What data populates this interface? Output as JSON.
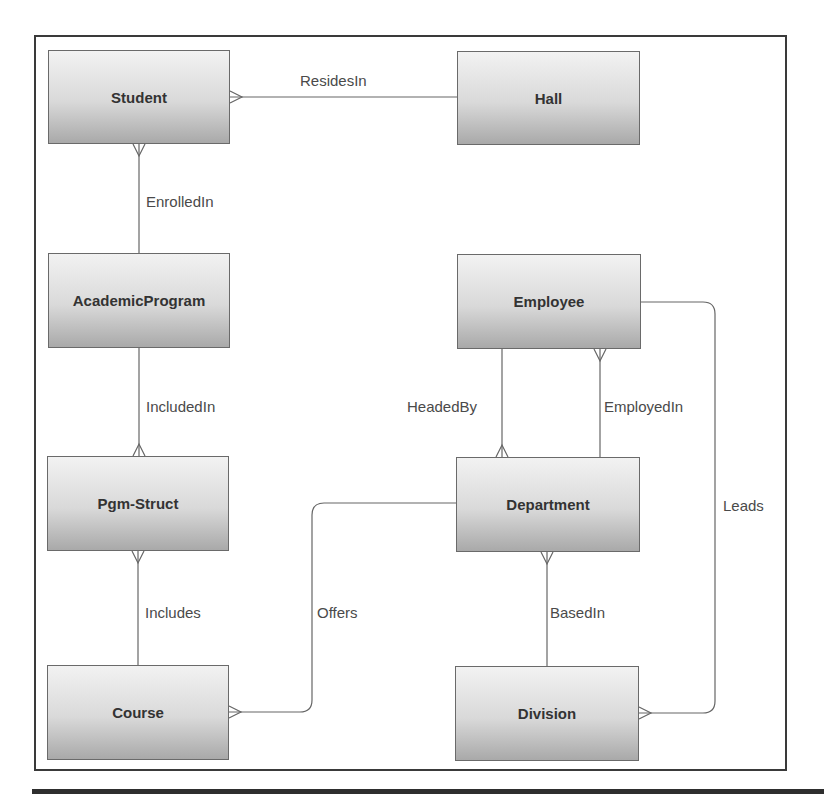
{
  "diagram": {
    "type": "entity-relationship",
    "notation": "crow's foot",
    "entities": [
      {
        "id": "student",
        "label": "Student",
        "x": 48,
        "y": 50,
        "w": 182,
        "h": 94
      },
      {
        "id": "hall",
        "label": "Hall",
        "x": 457,
        "y": 51,
        "w": 183,
        "h": 94
      },
      {
        "id": "academic_program",
        "label": "AcademicProgram",
        "x": 48,
        "y": 253,
        "w": 182,
        "h": 95
      },
      {
        "id": "employee",
        "label": "Employee",
        "x": 457,
        "y": 254,
        "w": 184,
        "h": 95
      },
      {
        "id": "pgm_struct",
        "label": "Pgm-Struct",
        "x": 47,
        "y": 456,
        "w": 182,
        "h": 95
      },
      {
        "id": "department",
        "label": "Department",
        "x": 456,
        "y": 457,
        "w": 184,
        "h": 95
      },
      {
        "id": "course",
        "label": "Course",
        "x": 47,
        "y": 665,
        "w": 182,
        "h": 95
      },
      {
        "id": "division",
        "label": "Division",
        "x": 455,
        "y": 666,
        "w": 184,
        "h": 95
      }
    ],
    "relationships": [
      {
        "label": "ResidesIn",
        "from": "Student",
        "to": "Hall",
        "many_end": "Student",
        "label_x": 300,
        "label_y": 72
      },
      {
        "label": "EnrolledIn",
        "from": "Student",
        "to": "AcademicProgram",
        "many_end": "Student",
        "label_x": 146,
        "label_y": 193
      },
      {
        "label": "IncludedIn",
        "from": "AcademicProgram",
        "to": "Pgm-Struct",
        "many_end": "Pgm-Struct",
        "label_x": 146,
        "label_y": 398
      },
      {
        "label": "Includes",
        "from": "Pgm-Struct",
        "to": "Course",
        "many_end": "Pgm-Struct",
        "label_x": 145,
        "label_y": 604
      },
      {
        "label": "Offers",
        "from": "Department",
        "to": "Course",
        "many_end": "Course",
        "label_x": 317,
        "label_y": 604
      },
      {
        "label": "HeadedBy",
        "from": "Employee",
        "to": "Department",
        "many_end": "Department",
        "label_x": 407,
        "label_y": 398
      },
      {
        "label": "EmployedIn",
        "from": "Employee",
        "to": "Department",
        "many_end": "Employee",
        "label_x": 604,
        "label_y": 398
      },
      {
        "label": "BasedIn",
        "from": "Department",
        "to": "Division",
        "many_end": "Department",
        "label_x": 550,
        "label_y": 604
      },
      {
        "label": "Leads",
        "from": "Employee",
        "to": "Division",
        "many_end": "Division",
        "label_x": 723,
        "label_y": 497
      }
    ]
  },
  "colors": {
    "frame": "#3a3a3a",
    "entity_border": "#6a6a6a",
    "entity_text": "#333333",
    "edge": "#666666",
    "label_text": "#4a4a4a"
  }
}
